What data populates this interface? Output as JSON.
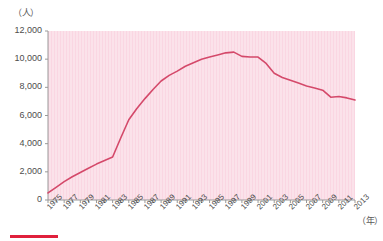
{
  "chart_data": {
    "type": "line",
    "title": "",
    "xlabel": "（年）",
    "ylabel": "（人）",
    "ylim": [
      0,
      12000
    ],
    "xlim": [
      1975,
      2013
    ],
    "grid": false,
    "legend_position": "bottom-left",
    "ytick_labels": [
      "12,000",
      "10,000",
      "8,000",
      "6,000",
      "4,000",
      "2,000",
      "0"
    ],
    "ytick_values": [
      12000,
      10000,
      8000,
      6000,
      4000,
      2000,
      0
    ],
    "xtick_labels": [
      "1975",
      "1977",
      "1979",
      "1981",
      "1983",
      "1985",
      "1987",
      "1989",
      "1991",
      "1993",
      "1995",
      "1997",
      "1999",
      "2001",
      "2003",
      "2005",
      "2007",
      "2009",
      "2011",
      "2013"
    ],
    "series": [
      {
        "name": "line-series-1",
        "color": "#d4496a",
        "x": [
          1975,
          1976,
          1977,
          1978,
          1979,
          1980,
          1981,
          1982,
          1983,
          1984,
          1985,
          1986,
          1987,
          1988,
          1989,
          1990,
          1991,
          1992,
          1993,
          1994,
          1995,
          1996,
          1997,
          1998,
          1999,
          2000,
          2001,
          2002,
          2003,
          2004,
          2005,
          2006,
          2007,
          2008,
          2009,
          2010,
          2011,
          2012,
          2013
        ],
        "values": [
          500,
          900,
          1300,
          1650,
          1950,
          2250,
          2550,
          2800,
          3050,
          4400,
          5700,
          6500,
          7200,
          7850,
          8450,
          8850,
          9150,
          9500,
          9750,
          10000,
          10150,
          10300,
          10450,
          10500,
          10200,
          10150,
          10150,
          9700,
          9000,
          8700,
          8500,
          8300,
          8100,
          7950,
          7800,
          7300,
          7350,
          7250,
          7100
        ]
      }
    ]
  },
  "axes": {
    "plot_bg_color": "#fbe2ea",
    "axis_line_color": "#999999"
  },
  "legend": {
    "swatch_color": "#e0203c",
    "label": ""
  }
}
